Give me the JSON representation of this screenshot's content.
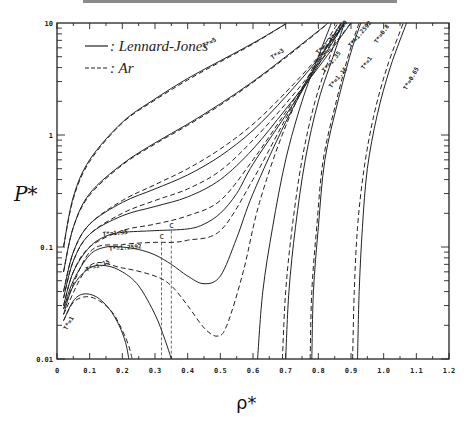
{
  "chart_data": {
    "type": "line",
    "title": "",
    "xlabel": "ρ*",
    "ylabel": "P*",
    "xlim": [
      0,
      1.2
    ],
    "ylim": [
      0.01,
      10
    ],
    "yscale": "log",
    "grid": false,
    "legend_position": "upper-left",
    "x_ticks": [
      "0",
      "0.1",
      "0.2",
      "0.3",
      "0.4",
      "0.5",
      "0.6",
      "0.7",
      "0.8",
      "0.9",
      "1.0",
      "1.1",
      "1.2"
    ],
    "y_ticks": [
      "0.01",
      "0.1",
      "1",
      "10"
    ],
    "legend": [
      {
        "label": ": Lennard-Jones",
        "style": "solid"
      },
      {
        "label": ": Ar",
        "style": "dashed"
      }
    ],
    "critical_point_labels": [
      "c",
      "c"
    ],
    "series": [
      {
        "name": "T*=5",
        "style": "solid",
        "points": [
          [
            0.02,
            0.1
          ],
          [
            0.05,
            0.28
          ],
          [
            0.1,
            0.6
          ],
          [
            0.2,
            1.3
          ],
          [
            0.3,
            2.1
          ],
          [
            0.4,
            3.2
          ],
          [
            0.5,
            4.6
          ],
          [
            0.6,
            6.6
          ],
          [
            0.7,
            9.8
          ]
        ]
      },
      {
        "name": "T*=5 (Ar)",
        "style": "dashed",
        "points": [
          [
            0.02,
            0.1
          ],
          [
            0.05,
            0.27
          ],
          [
            0.1,
            0.58
          ],
          [
            0.2,
            1.28
          ],
          [
            0.3,
            2.05
          ],
          [
            0.4,
            3.1
          ],
          [
            0.5,
            4.5
          ],
          [
            0.6,
            6.5
          ],
          [
            0.7,
            9.8
          ]
        ]
      },
      {
        "name": "T*=3",
        "style": "solid",
        "points": [
          [
            0.02,
            0.06
          ],
          [
            0.05,
            0.15
          ],
          [
            0.1,
            0.3
          ],
          [
            0.2,
            0.55
          ],
          [
            0.3,
            0.85
          ],
          [
            0.4,
            1.25
          ],
          [
            0.5,
            1.9
          ],
          [
            0.6,
            3.0
          ],
          [
            0.7,
            5.0
          ],
          [
            0.8,
            8.5
          ],
          [
            0.83,
            10
          ]
        ]
      },
      {
        "name": "T*=3 (Ar)",
        "style": "dashed",
        "points": [
          [
            0.02,
            0.06
          ],
          [
            0.05,
            0.15
          ],
          [
            0.1,
            0.29
          ],
          [
            0.2,
            0.54
          ],
          [
            0.3,
            0.83
          ],
          [
            0.4,
            1.22
          ],
          [
            0.5,
            1.85
          ],
          [
            0.6,
            2.95
          ],
          [
            0.7,
            4.9
          ],
          [
            0.8,
            8.4
          ],
          [
            0.83,
            10
          ]
        ]
      },
      {
        "name": "T*=2",
        "style": "solid",
        "points": [
          [
            0.02,
            0.04
          ],
          [
            0.05,
            0.09
          ],
          [
            0.1,
            0.16
          ],
          [
            0.2,
            0.25
          ],
          [
            0.3,
            0.33
          ],
          [
            0.4,
            0.44
          ],
          [
            0.5,
            0.65
          ],
          [
            0.6,
            1.1
          ],
          [
            0.7,
            2.2
          ],
          [
            0.8,
            4.8
          ],
          [
            0.88,
            10
          ]
        ]
      },
      {
        "name": "T*=2 (Ar)",
        "style": "dashed",
        "points": [
          [
            0.02,
            0.04
          ],
          [
            0.05,
            0.09
          ],
          [
            0.1,
            0.16
          ],
          [
            0.2,
            0.26
          ],
          [
            0.3,
            0.36
          ],
          [
            0.4,
            0.5
          ],
          [
            0.5,
            0.75
          ],
          [
            0.6,
            1.25
          ],
          [
            0.7,
            2.4
          ],
          [
            0.8,
            5.0
          ],
          [
            0.88,
            10
          ]
        ]
      },
      {
        "name": "T*=1.8",
        "style": "solid",
        "points": [
          [
            0.02,
            0.035
          ],
          [
            0.05,
            0.075
          ],
          [
            0.1,
            0.13
          ],
          [
            0.2,
            0.19
          ],
          [
            0.3,
            0.23
          ],
          [
            0.4,
            0.28
          ],
          [
            0.5,
            0.4
          ],
          [
            0.6,
            0.75
          ],
          [
            0.7,
            1.7
          ],
          [
            0.8,
            4.0
          ],
          [
            0.9,
            10
          ]
        ]
      },
      {
        "name": "T*=1.8 (Ar)",
        "style": "dashed",
        "points": [
          [
            0.02,
            0.035
          ],
          [
            0.05,
            0.075
          ],
          [
            0.1,
            0.13
          ],
          [
            0.2,
            0.2
          ],
          [
            0.3,
            0.26
          ],
          [
            0.4,
            0.33
          ],
          [
            0.5,
            0.48
          ],
          [
            0.6,
            0.9
          ],
          [
            0.7,
            1.9
          ],
          [
            0.8,
            4.3
          ],
          [
            0.9,
            10
          ]
        ]
      },
      {
        "name": "T*=1.35",
        "style": "solid",
        "points": [
          [
            0.02,
            0.03
          ],
          [
            0.05,
            0.06
          ],
          [
            0.1,
            0.1
          ],
          [
            0.15,
            0.125
          ],
          [
            0.2,
            0.135
          ],
          [
            0.3,
            0.14
          ],
          [
            0.4,
            0.145
          ],
          [
            0.45,
            0.16
          ],
          [
            0.5,
            0.2
          ],
          [
            0.55,
            0.3
          ],
          [
            0.6,
            0.55
          ],
          [
            0.7,
            1.5
          ],
          [
            0.8,
            4.2
          ],
          [
            0.88,
            10
          ]
        ]
      },
      {
        "name": "T*=1.35 (Ar)",
        "style": "dashed",
        "points": [
          [
            0.02,
            0.03
          ],
          [
            0.05,
            0.06
          ],
          [
            0.1,
            0.1
          ],
          [
            0.2,
            0.14
          ],
          [
            0.3,
            0.16
          ],
          [
            0.4,
            0.19
          ],
          [
            0.5,
            0.26
          ],
          [
            0.6,
            0.6
          ],
          [
            0.7,
            1.6
          ],
          [
            0.8,
            4.4
          ],
          [
            0.88,
            10
          ]
        ]
      },
      {
        "name": "T*=1.2592",
        "style": "solid",
        "points": [
          [
            0.02,
            0.028
          ],
          [
            0.05,
            0.05
          ],
          [
            0.1,
            0.085
          ],
          [
            0.15,
            0.1
          ],
          [
            0.2,
            0.1
          ],
          [
            0.25,
            0.095
          ],
          [
            0.3,
            0.085
          ],
          [
            0.35,
            0.07
          ],
          [
            0.4,
            0.055
          ],
          [
            0.45,
            0.047
          ],
          [
            0.5,
            0.055
          ],
          [
            0.55,
            0.12
          ],
          [
            0.6,
            0.3
          ],
          [
            0.7,
            1.3
          ],
          [
            0.8,
            4.5
          ],
          [
            0.87,
            10
          ]
        ]
      },
      {
        "name": "T*=1.2592 (Ar)",
        "style": "dashed",
        "points": [
          [
            0.02,
            0.028
          ],
          [
            0.1,
            0.09
          ],
          [
            0.2,
            0.105
          ],
          [
            0.3,
            0.11
          ],
          [
            0.35,
            0.11
          ],
          [
            0.4,
            0.115
          ],
          [
            0.5,
            0.14
          ],
          [
            0.6,
            0.4
          ],
          [
            0.7,
            1.4
          ],
          [
            0.8,
            4.7
          ],
          [
            0.87,
            10
          ]
        ]
      },
      {
        "name": "T*=1.15",
        "style": "solid",
        "points": [
          [
            0.02,
            0.025
          ],
          [
            0.05,
            0.045
          ],
          [
            0.1,
            0.065
          ],
          [
            0.15,
            0.068
          ],
          [
            0.2,
            0.06
          ],
          [
            0.25,
            0.045
          ],
          [
            0.3,
            0.025
          ],
          [
            0.33,
            0.015
          ],
          [
            0.35,
            0.01
          ]
        ]
      },
      {
        "name": "T*=1.15 (Ar)",
        "style": "dashed",
        "points": [
          [
            0.02,
            0.025
          ],
          [
            0.1,
            0.068
          ],
          [
            0.2,
            0.065
          ],
          [
            0.3,
            0.055
          ],
          [
            0.35,
            0.045
          ],
          [
            0.4,
            0.03
          ],
          [
            0.45,
            0.019
          ],
          [
            0.49,
            0.016
          ],
          [
            0.52,
            0.02
          ],
          [
            0.57,
            0.06
          ],
          [
            0.62,
            0.25
          ],
          [
            0.7,
            1.2
          ],
          [
            0.8,
            5.0
          ],
          [
            0.86,
            10
          ]
        ]
      },
      {
        "name": "T*=1",
        "style": "solid",
        "points": [
          [
            0.02,
            0.022
          ],
          [
            0.05,
            0.033
          ],
          [
            0.08,
            0.038
          ],
          [
            0.12,
            0.036
          ],
          [
            0.16,
            0.028
          ],
          [
            0.19,
            0.02
          ],
          [
            0.21,
            0.014
          ],
          [
            0.22,
            0.01
          ]
        ]
      },
      {
        "name": "T*=1 (Ar)",
        "style": "dashed",
        "points": [
          [
            0.02,
            0.022
          ],
          [
            0.05,
            0.032
          ],
          [
            0.09,
            0.036
          ],
          [
            0.13,
            0.033
          ],
          [
            0.17,
            0.026
          ],
          [
            0.2,
            0.018
          ],
          [
            0.22,
            0.013
          ],
          [
            0.23,
            0.01
          ]
        ]
      },
      {
        "name": "T*=1 liquid",
        "style": "solid",
        "points": [
          [
            0.614,
            0.01
          ],
          [
            0.63,
            0.04
          ],
          [
            0.66,
            0.15
          ],
          [
            0.7,
            0.6
          ],
          [
            0.75,
            2.0
          ],
          [
            0.8,
            5.0
          ],
          [
            0.84,
            10
          ]
        ]
      },
      {
        "name": "T*=0.8",
        "style": "solid",
        "points": [
          [
            0.7,
            0.01
          ],
          [
            0.71,
            0.04
          ],
          [
            0.73,
            0.15
          ],
          [
            0.76,
            0.6
          ],
          [
            0.8,
            2.0
          ],
          [
            0.85,
            5.5
          ],
          [
            0.88,
            10
          ]
        ]
      },
      {
        "name": "T*=0.8 (Ar)",
        "style": "dashed",
        "points": [
          [
            0.69,
            0.01
          ],
          [
            0.7,
            0.04
          ],
          [
            0.72,
            0.15
          ],
          [
            0.75,
            0.6
          ],
          [
            0.79,
            2.0
          ],
          [
            0.84,
            5.5
          ],
          [
            0.87,
            10
          ]
        ]
      },
      {
        "name": "T*=0.75",
        "style": "solid",
        "points": [
          [
            0.78,
            0.01
          ],
          [
            0.785,
            0.04
          ],
          [
            0.8,
            0.15
          ],
          [
            0.82,
            0.6
          ],
          [
            0.86,
            2.0
          ],
          [
            0.9,
            5.5
          ],
          [
            0.93,
            10
          ]
        ]
      },
      {
        "name": "T*=0.75 (Ar)",
        "style": "dashed",
        "points": [
          [
            0.775,
            0.01
          ],
          [
            0.78,
            0.04
          ],
          [
            0.795,
            0.15
          ],
          [
            0.815,
            0.6
          ],
          [
            0.855,
            2.0
          ],
          [
            0.895,
            5.5
          ],
          [
            0.925,
            10
          ]
        ]
      },
      {
        "name": "T*=0.65",
        "style": "solid",
        "points": [
          [
            0.92,
            0.01
          ],
          [
            0.925,
            0.04
          ],
          [
            0.935,
            0.15
          ],
          [
            0.95,
            0.5
          ],
          [
            0.98,
            1.5
          ],
          [
            1.02,
            4.0
          ],
          [
            1.07,
            10
          ]
        ]
      },
      {
        "name": "T*=0.65 (Ar)",
        "style": "dashed",
        "points": [
          [
            0.905,
            0.01
          ],
          [
            0.91,
            0.04
          ],
          [
            0.92,
            0.15
          ],
          [
            0.94,
            0.5
          ],
          [
            0.97,
            1.5
          ],
          [
            1.01,
            4.0
          ],
          [
            1.06,
            10
          ]
        ]
      }
    ],
    "curve_labels": [
      {
        "text": "T*=5",
        "x": 0.45,
        "y": 6.0,
        "rotate": -28
      },
      {
        "text": "T*=3",
        "x": 0.66,
        "y": 4.7,
        "rotate": -35
      },
      {
        "text": "T*=2",
        "x": 0.8,
        "y": 5.2,
        "rotate": -45
      },
      {
        "text": "T*=1.80",
        "x": 0.84,
        "y": 6.8,
        "rotate": -50
      },
      {
        "text": "T*=1.35",
        "x": 0.82,
        "y": 3.6,
        "rotate": -50
      },
      {
        "text": "T*=1.2592",
        "x": 0.9,
        "y": 6.0,
        "rotate": -50
      },
      {
        "text": "T*=1.15",
        "x": 0.84,
        "y": 2.6,
        "rotate": -50
      },
      {
        "text": "T*=1",
        "x": 0.94,
        "y": 3.8,
        "rotate": -55
      },
      {
        "text": "T*=0.8",
        "x": 0.98,
        "y": 6.5,
        "rotate": -55
      },
      {
        "text": "T*=0.65",
        "x": 1.07,
        "y": 2.5,
        "rotate": -60
      },
      {
        "text": "T*=1.35",
        "x": 0.14,
        "y": 0.125,
        "rotate": -5
      },
      {
        "text": "T*=1.2592",
        "x": 0.16,
        "y": 0.092,
        "rotate": -5
      },
      {
        "text": "T*=1.15",
        "x": 0.09,
        "y": 0.06,
        "rotate": -20
      },
      {
        "text": "T*=1",
        "x": 0.03,
        "y": 0.018,
        "rotate": -60
      }
    ]
  },
  "axis": {
    "xlabel": "ρ*",
    "ylabel": "P*"
  }
}
